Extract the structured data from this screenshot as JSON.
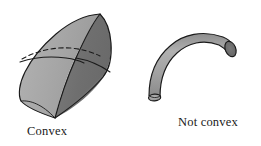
{
  "figure": {
    "background_color": "#ffffff",
    "stroke_color": "#1a1a1a",
    "captions": {
      "left": "Convex",
      "right": "Not convex"
    },
    "shapes": [
      {
        "id": "convex-solid",
        "name": "convex-solid",
        "label": "Convex",
        "description": "Lens-shaped convex solid with a meridian edge and a dashed hidden equator curve",
        "fill_light": "#a9a9a9",
        "fill_mid": "#8f8f8f",
        "fill_dark": "#6f6f6f",
        "outline": "#1a1a1a",
        "hidden_curve_style": "dashed"
      },
      {
        "id": "not-convex-tube",
        "name": "not-convex-tube",
        "label": "Not convex",
        "description": "Bent cylindrical tube, elbow shaped, with two elliptical end caps",
        "fill_light": "#a9a9a9",
        "fill_mid": "#9a9a9a",
        "fill_cap_near": "#9c9c9c",
        "fill_cap_far": "#6b6b6b",
        "outline": "#1a1a1a"
      }
    ]
  }
}
